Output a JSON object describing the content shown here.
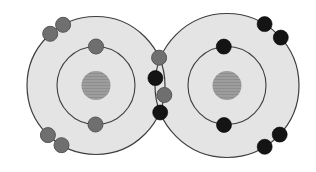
{
  "diagram": {
    "canvas": {
      "width": 316,
      "height": 172
    },
    "background": "#ffffff",
    "electron_radius": 7.5,
    "colors": {
      "atom_fill": "#e4e4e4",
      "shell_stroke": "#3d3d3d",
      "nucleus_fill": "#9d9d9d",
      "nucleus_line": "#8e8e8e",
      "left_electron_fill": "#6f6f6f",
      "left_electron_stroke": "#555555",
      "right_electron_fill": "#141414",
      "right_electron_stroke": "#000000"
    },
    "atoms": [
      {
        "id": "left",
        "cx": 96,
        "cy": 85.5,
        "outer_shell_r": 69,
        "inner_shell_r": 39,
        "nucleus_r": 14.5,
        "electron_style": "left"
      },
      {
        "id": "right",
        "cx": 227,
        "cy": 85.5,
        "outer_shell_r": 72,
        "inner_shell_r": 39,
        "nucleus_r": 14.5,
        "electron_style": "right"
      }
    ],
    "electrons": [
      {
        "atom": "left",
        "shell": "outer",
        "shared": false,
        "x": 50.2,
        "y": 33.8
      },
      {
        "atom": "left",
        "shell": "outer",
        "shared": false,
        "x": 63.1,
        "y": 24.8
      },
      {
        "atom": "left",
        "shell": "inner",
        "shared": false,
        "x": 96.0,
        "y": 46.5
      },
      {
        "atom": "left",
        "shell": "inner",
        "shared": false,
        "x": 95.5,
        "y": 124.5
      },
      {
        "atom": "left",
        "shell": "outer",
        "shared": false,
        "x": 47.9,
        "y": 135.1
      },
      {
        "atom": "left",
        "shell": "outer",
        "shared": false,
        "x": 61.5,
        "y": 145.2
      },
      {
        "atom": "left",
        "shell": "outer",
        "shared": true,
        "x": 159.1,
        "y": 57.7
      },
      {
        "atom": "left",
        "shell": "outer",
        "shared": true,
        "x": 164.3,
        "y": 95.0
      },
      {
        "atom": "right",
        "shell": "outer",
        "shared": true,
        "x": 155.4,
        "y": 78.1
      },
      {
        "atom": "right",
        "shell": "outer",
        "shared": true,
        "x": 160.2,
        "y": 112.5
      },
      {
        "atom": "right",
        "shell": "inner",
        "shared": false,
        "x": 223.8,
        "y": 46.6
      },
      {
        "atom": "right",
        "shell": "inner",
        "shared": false,
        "x": 224.0,
        "y": 125.0
      },
      {
        "atom": "right",
        "shell": "outer",
        "shared": false,
        "x": 264.6,
        "y": 24.1
      },
      {
        "atom": "right",
        "shell": "outer",
        "shared": false,
        "x": 280.8,
        "y": 37.6
      },
      {
        "atom": "right",
        "shell": "outer",
        "shared": false,
        "x": 279.7,
        "y": 134.6
      },
      {
        "atom": "right",
        "shell": "outer",
        "shared": false,
        "x": 264.7,
        "y": 146.8
      }
    ]
  }
}
